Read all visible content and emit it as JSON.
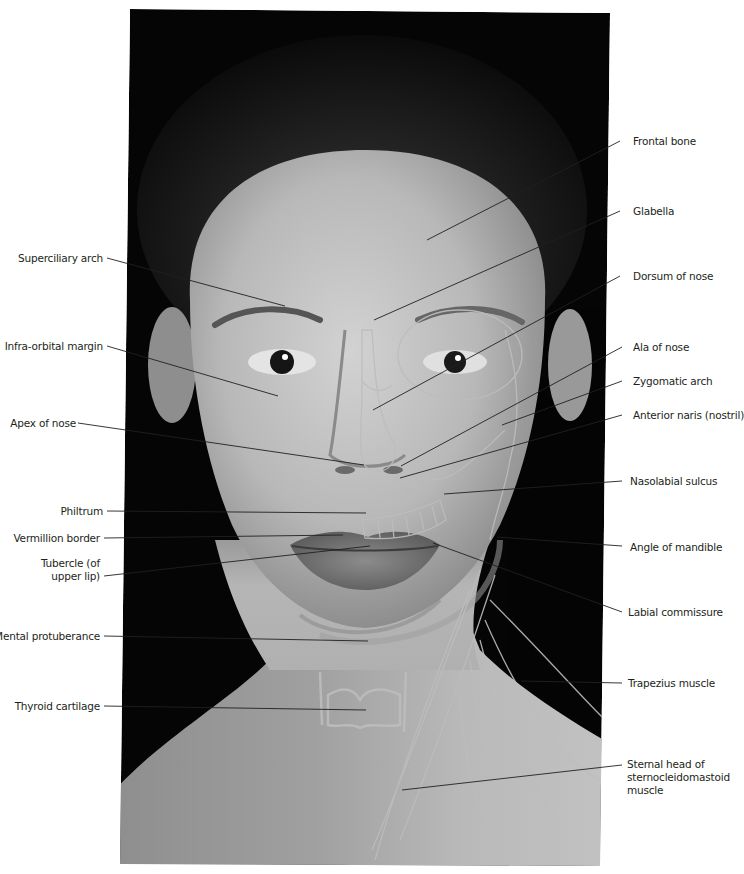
{
  "figure": {
    "colors": {
      "background": "#ffffff",
      "photo_bg": "#050505",
      "skin_light": "#c9c9c9",
      "skin_mid": "#a3a3a3",
      "overlay_lines": "#b8b8b8",
      "leader_lines": "#231f20",
      "label_text": "#231f20"
    }
  },
  "labels_left": [
    {
      "id": "superciliary-arch",
      "text": "Superciliary arch"
    },
    {
      "id": "infra-orbital-margin",
      "text": "Infra-orbital margin"
    },
    {
      "id": "apex-of-nose",
      "text": "Apex of nose"
    },
    {
      "id": "philtrum",
      "text": "Philtrum"
    },
    {
      "id": "vermillion-border",
      "text": "Vermillion border"
    },
    {
      "id": "tubercle-upper-lip",
      "text": "Tubercle (of\nupper lip)"
    },
    {
      "id": "mental-protuberance",
      "text": "Mental protuberance"
    },
    {
      "id": "thyroid-cartilage",
      "text": "Thyroid cartilage"
    }
  ],
  "labels_right": [
    {
      "id": "frontal-bone",
      "text": "Frontal bone"
    },
    {
      "id": "glabella",
      "text": "Glabella"
    },
    {
      "id": "dorsum-of-nose",
      "text": "Dorsum of nose"
    },
    {
      "id": "ala-of-nose",
      "text": "Ala of nose"
    },
    {
      "id": "zygomatic-arch",
      "text": "Zygomatic arch"
    },
    {
      "id": "anterior-naris",
      "text": "Anterior naris (nostril)"
    },
    {
      "id": "nasolabial-sulcus",
      "text": "Nasolabial sulcus"
    },
    {
      "id": "angle-of-mandible",
      "text": "Angle of mandible"
    },
    {
      "id": "labial-commissure",
      "text": "Labial commissure"
    },
    {
      "id": "trapezius-muscle",
      "text": "Trapezius muscle"
    },
    {
      "id": "sternal-head-scm",
      "text": "Sternal head of\nsternocleidomastoid\nmuscle"
    }
  ]
}
